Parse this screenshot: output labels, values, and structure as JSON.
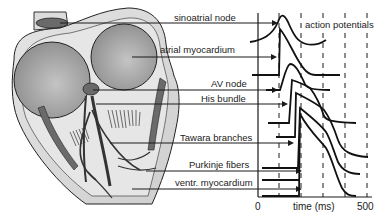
{
  "figure": {
    "type": "cardiac conduction system with action potentials",
    "labels": [
      {
        "id": "sinoatrial-node",
        "text": "sinoatrial node"
      },
      {
        "id": "atrial-myocardium",
        "text": "atrial myocardium"
      },
      {
        "id": "av-node",
        "text": "AV node"
      },
      {
        "id": "his-bundle",
        "text": "His bundle"
      },
      {
        "id": "tawara-branches",
        "text": "Tawara branches"
      },
      {
        "id": "purkinje-fibers",
        "text": "Purkinje fibers"
      },
      {
        "id": "ventr-myocardium",
        "text": "ventr. myocardium"
      }
    ],
    "panel_title": "action potentials",
    "axis": {
      "xlabel": "time (ms)",
      "tick_start": "0",
      "tick_end": "500"
    },
    "colors": {
      "line": "#1a1a1a",
      "heart_outer": "#d9d9d9",
      "heart_chamber": "#a8a8a8",
      "heart_dark": "#5a5a5a",
      "background": "#ffffff"
    }
  }
}
